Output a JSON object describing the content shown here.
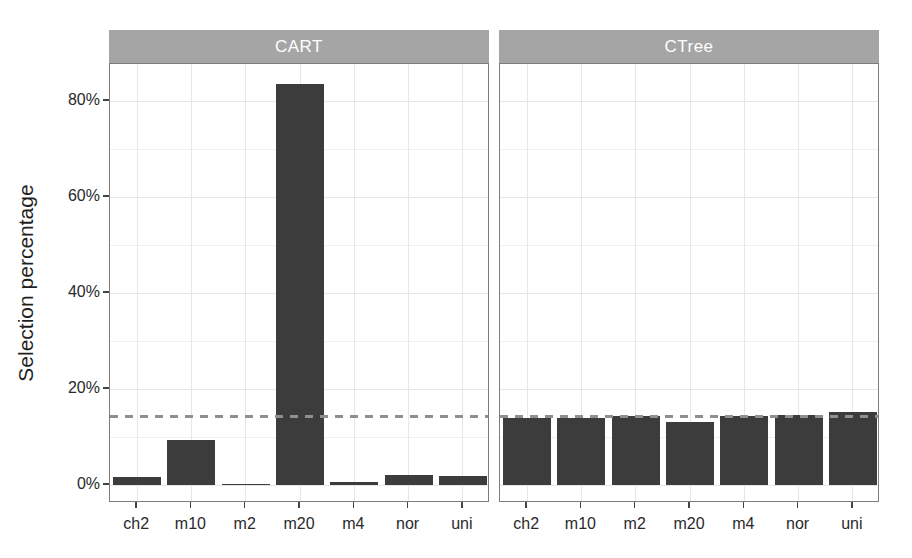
{
  "chart_data": {
    "type": "bar",
    "title": "",
    "ylabel": "Selection percentage",
    "xlabel": "",
    "categories": [
      "ch2",
      "m10",
      "m2",
      "m20",
      "m4",
      "nor",
      "uni"
    ],
    "facets": [
      {
        "label": "CART",
        "values": [
          1.7,
          9.4,
          0.3,
          83.5,
          0.7,
          2.1,
          1.9
        ]
      },
      {
        "label": "CTree",
        "values": [
          14.0,
          13.9,
          14.4,
          13.1,
          14.4,
          14.6,
          15.2
        ]
      }
    ],
    "yticks": {
      "values": [
        0,
        20,
        40,
        60,
        80
      ],
      "labels": [
        "0%",
        "20%",
        "40%",
        "60%",
        "80%"
      ]
    },
    "ylim": [
      -3.8,
      87.7
    ],
    "grid": {
      "horizontal_minor_step": 10,
      "vertical_at_categories": true
    },
    "reference_line": {
      "value": 14.3,
      "style": "dashed"
    },
    "legend": "none",
    "colors": {
      "bar": "#3c3c3c",
      "strip_bg": "#a5a5a5",
      "strip_text": "#ffffff",
      "panel_border": "#7d7d7d",
      "grid_major": "#e6e6e6",
      "grid_minor": "#f0f0f0",
      "reference": "#8f8f8f",
      "tick": "#444444",
      "axis_text": "#2a2a2a"
    }
  }
}
